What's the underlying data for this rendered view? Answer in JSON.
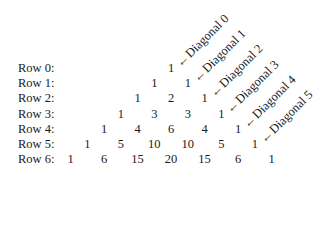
{
  "rows": [
    {
      "label": "Row 0:",
      "values": [
        "1"
      ]
    },
    {
      "label": "Row 1:",
      "values": [
        "1",
        "1"
      ]
    },
    {
      "label": "Row 2:",
      "values": [
        "1",
        "2",
        "1"
      ]
    },
    {
      "label": "Row 3:",
      "values": [
        "1",
        "3",
        "3",
        "1"
      ]
    },
    {
      "label": "Row 4:",
      "values": [
        "1",
        "4",
        "6",
        "4",
        "1"
      ]
    },
    {
      "label": "Row 5:",
      "values": [
        "1",
        "5",
        "10",
        "10",
        "5",
        "1"
      ]
    },
    {
      "label": "Row 6:",
      "values": [
        "1",
        "6",
        "15",
        "20",
        "15",
        "6",
        "1"
      ]
    }
  ],
  "diagonals": [
    {
      "label": "Diagonal 0",
      "arrow": "←"
    },
    {
      "label": "Diagonal 1",
      "arrow": "←"
    },
    {
      "label": "Diagonal 2",
      "arrow": "←"
    },
    {
      "label": "Diagonal 3",
      "arrow": "←"
    },
    {
      "label": "Diagonal 4",
      "arrow": "←"
    },
    {
      "label": "Diagonal 5",
      "arrow": "←"
    }
  ]
}
